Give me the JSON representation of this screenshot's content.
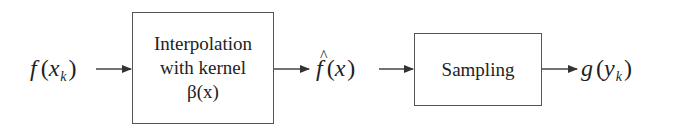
{
  "diagram": {
    "type": "block-diagram",
    "flow": "left-to-right",
    "input": {
      "func": "f",
      "var": "x",
      "subscript": "k",
      "text": "f(x_k)"
    },
    "blocks": [
      {
        "id": "interpolation",
        "lines": [
          "Interpolation",
          "with kernel",
          "β(x)"
        ]
      },
      {
        "id": "sampling",
        "lines": [
          "Sampling"
        ]
      }
    ],
    "intermediate": {
      "func": "f",
      "hat": "^",
      "var": "x",
      "text": "f̂(x)"
    },
    "output": {
      "func": "g",
      "var": "y",
      "subscript": "k",
      "text": "g(y_k)"
    },
    "edges": [
      {
        "from": "f(x_k)",
        "to": "interpolation"
      },
      {
        "from": "interpolation",
        "to": "f̂(x)"
      },
      {
        "from": "f̂(x)",
        "to": "sampling"
      },
      {
        "from": "sampling",
        "to": "g(y_k)"
      }
    ],
    "colors": {
      "line": "#555555",
      "text": "#222222",
      "background": "#ffffff"
    }
  },
  "punct": {
    "open": "(",
    "close": ")"
  }
}
